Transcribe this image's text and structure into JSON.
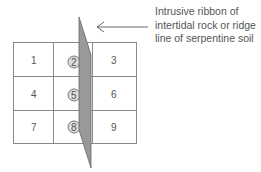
{
  "diagram": {
    "caption_lines": [
      "Intrusive ribbon of",
      "intertidal rock or ridge",
      "line of serpentine soil"
    ],
    "grid": {
      "rows": 3,
      "cols": 3,
      "cells": [
        "1",
        "2",
        "3",
        "4",
        "5",
        "6",
        "7",
        "8",
        "9"
      ],
      "highlighted_cells": [
        "2",
        "5",
        "8"
      ]
    },
    "colors": {
      "grid_line": "#888888",
      "ribbon_fill": "#999999",
      "ribbon_stroke": "#666666",
      "circle_fill": "#dddddd",
      "text": "#555555"
    },
    "arrow": {
      "direction": "left",
      "points_to": "ribbon"
    }
  }
}
